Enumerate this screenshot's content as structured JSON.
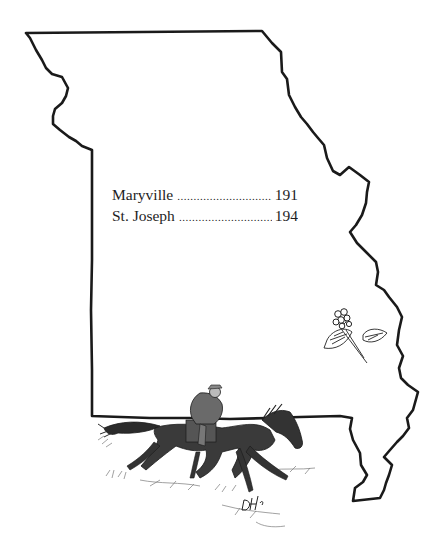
{
  "map": {
    "region": "Missouri",
    "decoration_state_flower": "hawthorn-blossom",
    "decoration_illustration": "pony-express-rider",
    "artist_signature": "DH"
  },
  "index": {
    "entries": [
      {
        "name": "Maryville",
        "page": "191"
      },
      {
        "name": "St. Joseph",
        "page": "194"
      }
    ]
  },
  "colors": {
    "outline": "#1a1a1a",
    "text": "#1e1e1e",
    "background": "#ffffff"
  }
}
